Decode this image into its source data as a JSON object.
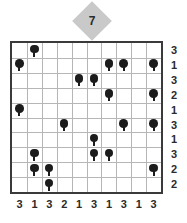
{
  "badge": {
    "label": "7",
    "shape": "diamond-badge",
    "color": "#c9c9c9"
  },
  "board": {
    "rows": 10,
    "cols": 10,
    "border_color": "#3a3a3a",
    "gridline_color": "#b6b6b6",
    "tree_color": "#1c1c1c"
  },
  "row_clues": [
    3,
    1,
    3,
    2,
    1,
    3,
    1,
    3,
    2,
    2
  ],
  "col_clues": [
    3,
    1,
    3,
    2,
    1,
    3,
    1,
    3,
    1,
    3
  ],
  "trees": [
    {
      "row": 1,
      "col": 2
    },
    {
      "row": 2,
      "col": 1
    },
    {
      "row": 2,
      "col": 7
    },
    {
      "row": 2,
      "col": 8
    },
    {
      "row": 2,
      "col": 10
    },
    {
      "row": 3,
      "col": 5
    },
    {
      "row": 3,
      "col": 6
    },
    {
      "row": 4,
      "col": 7
    },
    {
      "row": 4,
      "col": 10
    },
    {
      "row": 5,
      "col": 1
    },
    {
      "row": 6,
      "col": 4
    },
    {
      "row": 6,
      "col": 8
    },
    {
      "row": 6,
      "col": 10
    },
    {
      "row": 7,
      "col": 6
    },
    {
      "row": 8,
      "col": 2
    },
    {
      "row": 8,
      "col": 6
    },
    {
      "row": 8,
      "col": 7
    },
    {
      "row": 9,
      "col": 2
    },
    {
      "row": 9,
      "col": 3
    },
    {
      "row": 9,
      "col": 10
    },
    {
      "row": 10,
      "col": 3
    }
  ]
}
